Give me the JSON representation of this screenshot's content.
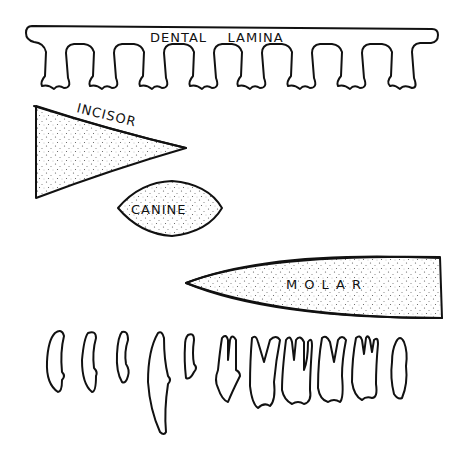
{
  "diagram": {
    "labels": {
      "dental_lamina": "DENTAL    LAMINA",
      "incisor": "INCISOR",
      "canine": "CANINE",
      "molar": "MOLAR"
    },
    "lamina": {
      "bud_count": 11
    },
    "teeth_row": {
      "tooth_count": 12,
      "types": [
        "incisor",
        "incisor",
        "incisor",
        "canine",
        "premolar",
        "premolar",
        "molar",
        "molar",
        "molar",
        "molar",
        "molar",
        "molar"
      ]
    },
    "colors": {
      "line": "#111111",
      "background": "#ffffff",
      "stipple": "#555555"
    }
  }
}
